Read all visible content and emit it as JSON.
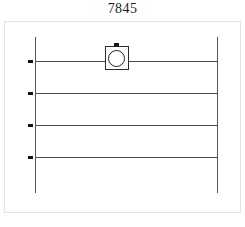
{
  "page": {
    "title": "7845",
    "background_color": "#ffffff"
  },
  "panel": {
    "border_color": "#e3e3e3",
    "background_color": "#ffffff"
  },
  "diagram": {
    "line_color": "#4a4a4c",
    "rail_color": "#59595b",
    "marker_color": "#141414",
    "node_color": "#2b2b2b",
    "rails": [
      {
        "name": "left-rail",
        "x": 35,
        "y_top": 37,
        "y_bottom": 193
      },
      {
        "name": "right-rail",
        "x": 217,
        "y_top": 37,
        "y_bottom": 193
      }
    ],
    "lines": [
      {
        "index": 1,
        "y": 61,
        "x_start": 35,
        "x_end": 218
      },
      {
        "index": 2,
        "y": 93,
        "x_start": 35,
        "x_end": 218
      },
      {
        "index": 3,
        "y": 125,
        "x_start": 35,
        "x_end": 218
      },
      {
        "index": 4,
        "y": 157,
        "x_start": 35,
        "x_end": 218
      }
    ],
    "markers": [
      {
        "index": 1,
        "x": 28,
        "y": 60
      },
      {
        "index": 2,
        "x": 92,
        "y": 92
      },
      {
        "index": 3,
        "x": 28,
        "y": 124
      },
      {
        "index": 4,
        "x": 28,
        "y": 156
      }
    ],
    "node": {
      "name": "square-circle-node",
      "x": 105,
      "y": 46,
      "width": 24,
      "height": 24,
      "on_line_index": 1,
      "has_top_tab": true
    }
  }
}
